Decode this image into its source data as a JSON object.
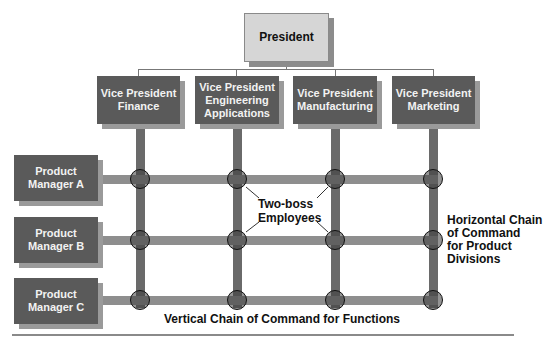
{
  "diagram": {
    "top_caption_partial": "",
    "president": {
      "label": "President"
    },
    "vice_presidents": [
      {
        "label": "Vice President\nFinance",
        "line1": "Vice President",
        "line2": "Finance",
        "line3": ""
      },
      {
        "label": "Vice President\nEngineering\nApplications",
        "line1": "Vice President",
        "line2": "Engineering",
        "line3": "Applications"
      },
      {
        "label": "Vice President\nManufacturing",
        "line1": "Vice President",
        "line2": "Manufacturing",
        "line3": ""
      },
      {
        "label": "Vice President\nMarketing",
        "line1": "Vice President",
        "line2": "Marketing",
        "line3": ""
      }
    ],
    "product_managers": [
      {
        "line1": "Product",
        "line2": "Manager A"
      },
      {
        "line1": "Product",
        "line2": "Manager B"
      },
      {
        "line1": "Product",
        "line2": "Manager C"
      }
    ],
    "annotations": {
      "two_boss_line1": "Two-boss",
      "two_boss_line2": "Employees",
      "horizontal_line1": "Horizontal Chain",
      "horizontal_line2": "of Command",
      "horizontal_line3": "for Product",
      "horizontal_line4": "Divisions",
      "vertical": "Vertical Chain of Command for Functions"
    },
    "colors": {
      "dark_box": "#5a5a5a",
      "light_box": "#d6d6d6",
      "vertical_bar": "#6a6a6a",
      "horizontal_bar": "#8e8e8e"
    }
  }
}
